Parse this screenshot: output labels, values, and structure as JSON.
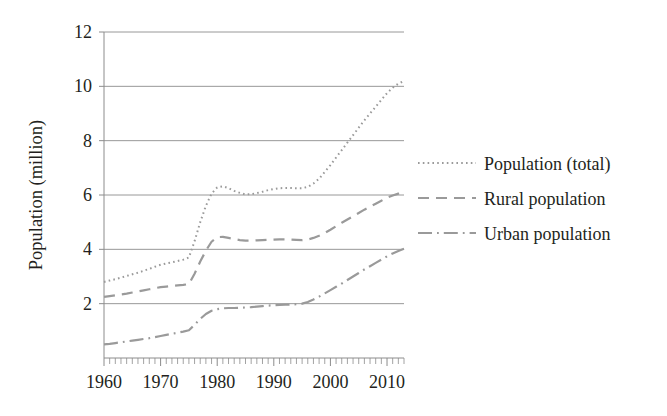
{
  "chart_data": {
    "type": "line",
    "title": "",
    "xlabel": "",
    "ylabel": "Population (million)",
    "xlim": [
      1960,
      2013
    ],
    "ylim": [
      0,
      12
    ],
    "grid": true,
    "legend_position": "right",
    "x_ticks": [
      1960,
      1970,
      1980,
      1990,
      2000,
      2010
    ],
    "x_tick_labels": [
      "1960",
      "1970",
      "1980",
      "1990",
      "2000",
      "2010"
    ],
    "x_minor_tick_step": 1,
    "y_ticks": [
      2,
      4,
      6,
      8,
      10,
      12
    ],
    "y_tick_labels": [
      "2",
      "4",
      "6",
      "8",
      "10",
      "12"
    ],
    "x": [
      1960,
      1961,
      1962,
      1963,
      1964,
      1965,
      1966,
      1967,
      1968,
      1969,
      1970,
      1971,
      1972,
      1973,
      1974,
      1975,
      1976,
      1977,
      1978,
      1979,
      1980,
      1981,
      1982,
      1983,
      1984,
      1985,
      1986,
      1987,
      1988,
      1989,
      1990,
      1991,
      1992,
      1993,
      1994,
      1995,
      1996,
      1997,
      1998,
      1999,
      2000,
      2001,
      2002,
      2003,
      2004,
      2005,
      2006,
      2007,
      2008,
      2009,
      2010,
      2011,
      2012,
      2013
    ],
    "series": [
      {
        "name": "Population (total)",
        "style": "dotted",
        "color": "#9a9a9a",
        "values": [
          2.8,
          2.85,
          2.9,
          2.96,
          3.02,
          3.08,
          3.14,
          3.21,
          3.28,
          3.36,
          3.43,
          3.48,
          3.52,
          3.57,
          3.62,
          3.7,
          4.3,
          5.0,
          5.6,
          6.05,
          6.28,
          6.32,
          6.25,
          6.15,
          6.08,
          6.02,
          6.03,
          6.07,
          6.12,
          6.18,
          6.22,
          6.25,
          6.26,
          6.26,
          6.25,
          6.25,
          6.3,
          6.42,
          6.6,
          6.85,
          7.1,
          7.38,
          7.65,
          7.93,
          8.2,
          8.48,
          8.75,
          9.0,
          9.25,
          9.5,
          9.75,
          9.95,
          10.1,
          10.2
        ]
      },
      {
        "name": "Rural population",
        "style": "dashed",
        "color": "#9a9a9a",
        "values": [
          2.25,
          2.28,
          2.31,
          2.34,
          2.37,
          2.41,
          2.45,
          2.49,
          2.53,
          2.57,
          2.61,
          2.63,
          2.65,
          2.67,
          2.69,
          2.72,
          3.1,
          3.55,
          3.95,
          4.28,
          4.45,
          4.46,
          4.42,
          4.38,
          4.34,
          4.32,
          4.32,
          4.33,
          4.34,
          4.35,
          4.36,
          4.37,
          4.37,
          4.36,
          4.35,
          4.34,
          4.36,
          4.42,
          4.5,
          4.6,
          4.72,
          4.85,
          4.98,
          5.1,
          5.22,
          5.34,
          5.46,
          5.57,
          5.68,
          5.79,
          5.9,
          5.98,
          6.05,
          6.1
        ]
      },
      {
        "name": "Urban population",
        "style": "dashdot",
        "color": "#9a9a9a",
        "values": [
          0.5,
          0.52,
          0.55,
          0.58,
          0.61,
          0.64,
          0.67,
          0.7,
          0.73,
          0.77,
          0.81,
          0.85,
          0.89,
          0.93,
          0.97,
          1.02,
          1.22,
          1.44,
          1.62,
          1.74,
          1.8,
          1.83,
          1.84,
          1.84,
          1.85,
          1.86,
          1.87,
          1.89,
          1.91,
          1.93,
          1.94,
          1.95,
          1.96,
          1.97,
          1.98,
          2.0,
          2.06,
          2.15,
          2.26,
          2.38,
          2.5,
          2.62,
          2.74,
          2.87,
          3.0,
          3.13,
          3.26,
          3.38,
          3.5,
          3.62,
          3.74,
          3.85,
          3.94,
          4.02
        ]
      }
    ]
  },
  "legend": {
    "items": [
      {
        "label": "Population (total)",
        "style": "dotted"
      },
      {
        "label": "Rural population",
        "style": "dashed"
      },
      {
        "label": "Urban population",
        "style": "dashdot"
      }
    ]
  },
  "axes": {
    "y_title": "Population (million)"
  }
}
